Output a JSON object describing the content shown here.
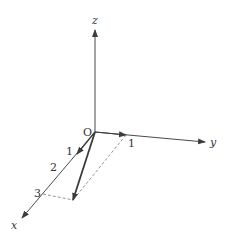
{
  "diagram": {
    "type": "3d-coordinate-axes-vector",
    "origin_label": "O",
    "axes": {
      "x": {
        "label": "x",
        "ticks": [
          "1",
          "2",
          "3"
        ]
      },
      "y": {
        "label": "y",
        "ticks": [
          "1"
        ]
      },
      "z": {
        "label": "z",
        "ticks": []
      }
    },
    "vectors": [
      {
        "name": "unit-x",
        "from": "O",
        "to": "x=1"
      },
      {
        "name": "unit-y",
        "from": "O",
        "to": "y=1"
      },
      {
        "name": "resultant",
        "from": "O",
        "to": "(3,1,0)"
      }
    ],
    "guides": [
      {
        "name": "dashed-from-x3",
        "from": "x=3",
        "to": "(3,1,0)"
      },
      {
        "name": "dashed-from-y1",
        "from": "y=1",
        "to": "(3,1,0)"
      }
    ],
    "colors": {
      "axis": "#4a4a4a",
      "vector": "#3c3c3c",
      "dashed": "#8a8a8a",
      "text": "#333333"
    }
  }
}
